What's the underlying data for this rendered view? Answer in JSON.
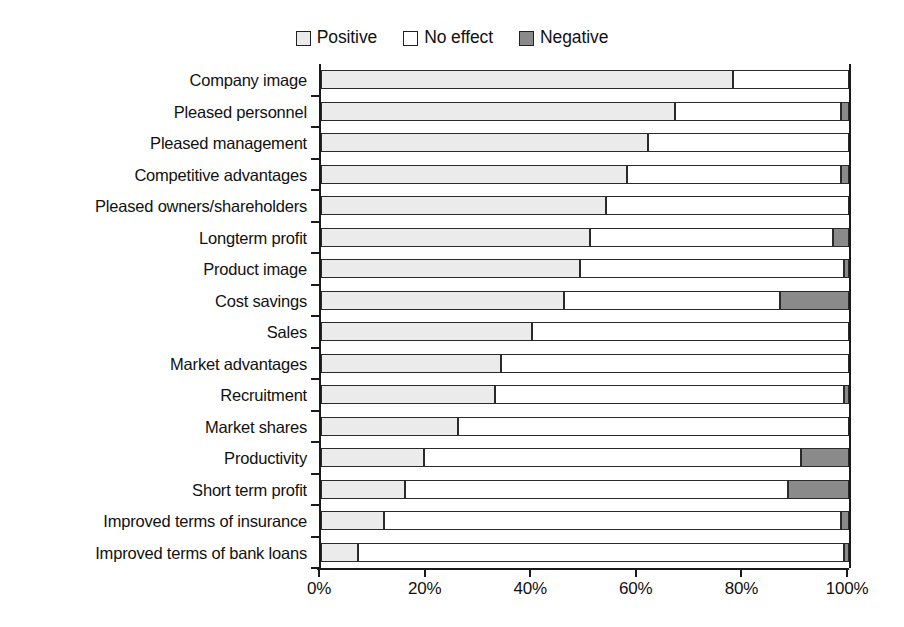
{
  "chart_data": {
    "type": "bar",
    "orientation": "horizontal",
    "stacked": true,
    "stack_mode": "percent",
    "title": "",
    "subtitle": "",
    "xlabel": "",
    "ylabel": "",
    "xlim": [
      0,
      100
    ],
    "xtick_labels": [
      "0%",
      "20%",
      "40%",
      "60%",
      "80%",
      "100%"
    ],
    "xtick_values": [
      0,
      20,
      40,
      60,
      80,
      100
    ],
    "grid": false,
    "legend_position": "top-center",
    "legend": [
      "Positive",
      "No effect",
      "Negative"
    ],
    "series_colors": {
      "Positive": "#ebebeb",
      "No effect": "#ffffff",
      "Negative": "#8a8a8a"
    },
    "categories": [
      "Company image",
      "Pleased personnel",
      "Pleased management",
      "Competitive advantages",
      "Pleased owners/shareholders",
      "Longterm profit",
      "Product image",
      "Cost savings",
      "Sales",
      "Market advantages",
      "Recruitment",
      "Market shares",
      "Productivity",
      "Short term profit",
      "Improved terms of insurance",
      "Improved terms of bank loans"
    ],
    "series": [
      {
        "name": "Positive",
        "values": [
          78,
          67,
          62,
          58,
          54,
          51,
          49,
          46,
          40,
          34,
          33,
          26,
          19.5,
          16,
          12,
          7
        ]
      },
      {
        "name": "No effect",
        "values": [
          22,
          31.5,
          38,
          40.5,
          46,
          46,
          50,
          41,
          60,
          66,
          66,
          74,
          71.5,
          72.5,
          86.5,
          92
        ]
      },
      {
        "name": "Negative",
        "values": [
          0,
          1.5,
          0,
          1.5,
          0,
          3,
          1,
          13,
          0,
          0,
          1,
          0,
          9,
          11.5,
          1.5,
          1
        ]
      }
    ]
  }
}
